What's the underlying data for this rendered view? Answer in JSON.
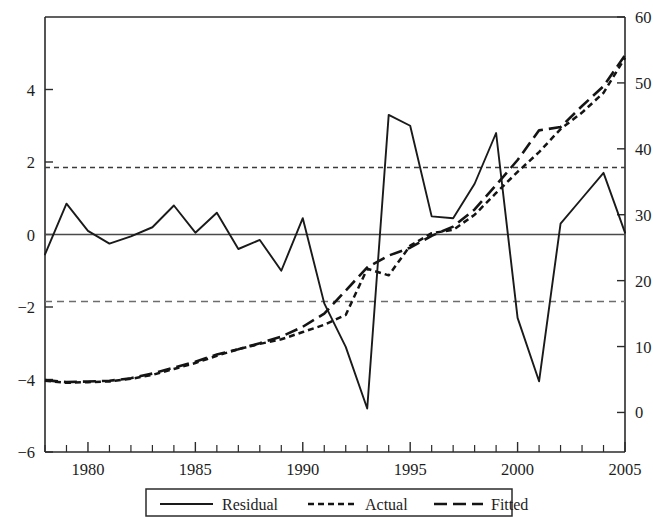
{
  "chart_data": {
    "type": "line",
    "title": "",
    "subtitle": "",
    "xlabel": "",
    "ylabel": "",
    "y2label": "",
    "grid": false,
    "legend_position": "bottom",
    "xlim": [
      1978,
      2005
    ],
    "ylim": [
      -6,
      6
    ],
    "y2lim": [
      -6,
      60
    ],
    "x_tick_labels": [
      "1980",
      "1985",
      "1990",
      "1995",
      "2000",
      "2005"
    ],
    "x_tick_values": [
      1980,
      1985,
      1990,
      1995,
      2000,
      2005
    ],
    "x_minor_tick_values": [
      1978,
      1979,
      1980,
      1981,
      1982,
      1983,
      1984,
      1985,
      1986,
      1987,
      1988,
      1989,
      1990,
      1991,
      1992,
      1993,
      1994,
      1995,
      1996,
      1997,
      1998,
      1999,
      2000,
      2001,
      2002,
      2003,
      2004,
      2005
    ],
    "y_tick_labels": [
      "4",
      "2",
      "0",
      "-2",
      "-4",
      "-6"
    ],
    "y_tick_values": [
      4,
      2,
      0,
      -2,
      -4,
      -6
    ],
    "y2_tick_labels": [
      "60",
      "50",
      "40",
      "30",
      "20",
      "10",
      "0"
    ],
    "y2_tick_values": [
      60,
      50,
      40,
      30,
      20,
      10,
      0
    ],
    "x": [
      1978,
      1979,
      1980,
      1981,
      1982,
      1983,
      1984,
      1985,
      1986,
      1987,
      1988,
      1989,
      1990,
      1991,
      1992,
      1993,
      1994,
      1995,
      1996,
      1997,
      1998,
      1999,
      2000,
      2001,
      2002,
      2003,
      2004,
      2005
    ],
    "series": [
      {
        "name": "Residual",
        "axis": "left",
        "style": "solid",
        "values": [
          -0.55,
          0.85,
          0.1,
          -0.25,
          -0.05,
          0.2,
          0.8,
          0.05,
          0.6,
          -0.4,
          -0.15,
          -1.0,
          0.45,
          -1.9,
          -3.1,
          -4.8,
          3.3,
          3.0,
          0.5,
          0.45,
          1.4,
          2.8,
          -2.3,
          -4.05,
          0.3,
          1.0,
          1.7,
          0.05
        ]
      },
      {
        "name": "Actual",
        "axis": "right",
        "style": "fine-dashed",
        "values": [
          4.8,
          4.5,
          4.6,
          4.7,
          5.1,
          5.7,
          6.6,
          7.5,
          8.6,
          9.6,
          10.4,
          11.1,
          12.2,
          13.3,
          14.8,
          21.8,
          20.8,
          25.3,
          27.2,
          27.7,
          30.0,
          33.3,
          36.5,
          39.5,
          43.0,
          45.5,
          48.5,
          53.8
        ]
      },
      {
        "name": "Fitted",
        "axis": "right",
        "style": "long-dashed",
        "values": [
          4.9,
          4.6,
          4.7,
          4.8,
          5.2,
          5.9,
          6.8,
          7.7,
          8.8,
          9.6,
          10.5,
          11.5,
          13.0,
          15.0,
          18.5,
          22.0,
          23.8,
          25.0,
          26.8,
          28.2,
          30.8,
          34.5,
          38.3,
          42.8,
          43.3,
          46.5,
          49.5,
          54.2
        ]
      }
    ],
    "reference_lines": [
      {
        "name": "upper-bound",
        "axis": "left",
        "value": 1.85,
        "style": "fine-dashed"
      },
      {
        "name": "zero-line",
        "axis": "left",
        "value": 0,
        "style": "solid"
      },
      {
        "name": "lower-bound",
        "axis": "left",
        "value": -1.85,
        "style": "long-dashed"
      }
    ],
    "colors": {
      "residual": "#1a1a1a",
      "actual": "#141414",
      "fitted": "#141414",
      "axis": "#2b2b2b",
      "background": "#ffffff"
    }
  },
  "legend": {
    "items": [
      {
        "label": "Residual",
        "style": "solid"
      },
      {
        "label": "Actual",
        "style": "fine-dashed"
      },
      {
        "label": "Fitted",
        "style": "long-dashed"
      }
    ]
  },
  "axes": {
    "left": {
      "labels": [
        "4",
        "2",
        "0",
        "-2",
        "-4",
        "-6"
      ]
    },
    "right": {
      "labels": [
        "60",
        "50",
        "40",
        "30",
        "20",
        "10",
        "0"
      ]
    },
    "bottom": {
      "labels": [
        "1980",
        "1985",
        "1990",
        "1995",
        "2000",
        "2005"
      ]
    }
  }
}
